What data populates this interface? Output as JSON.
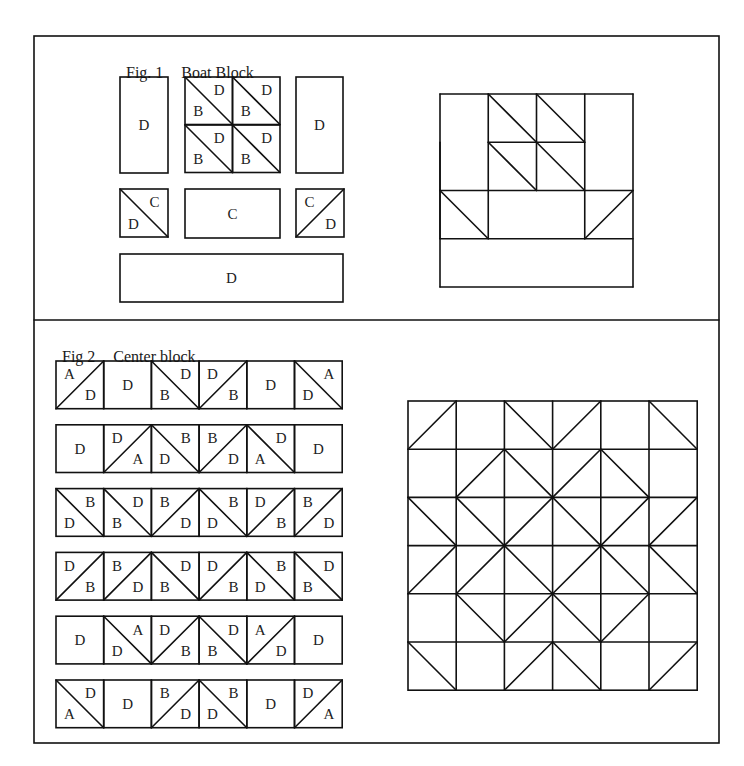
{
  "fig1": {
    "label": "Fig. 1",
    "title": "Boat Block",
    "pieces": [
      {
        "type": "rect",
        "x": 120,
        "y": 77,
        "w": 48,
        "h": 96,
        "label": "D"
      },
      {
        "type": "hst",
        "x": 185,
        "y": 77,
        "s": 47.5,
        "diag": "\\",
        "tl": null,
        "tr": "D",
        "bl": "B",
        "br": null
      },
      {
        "type": "hst",
        "x": 232.5,
        "y": 77,
        "s": 47.5,
        "diag": "\\",
        "tl": null,
        "tr": "D",
        "bl": "B",
        "br": null
      },
      {
        "type": "hst",
        "x": 185,
        "y": 125,
        "s": 47.5,
        "diag": "\\",
        "tl": null,
        "tr": "D",
        "bl": "B",
        "br": null
      },
      {
        "type": "hst",
        "x": 232.5,
        "y": 125,
        "s": 47.5,
        "diag": "\\",
        "tl": null,
        "tr": "D",
        "bl": "B",
        "br": null
      },
      {
        "type": "rect",
        "x": 296,
        "y": 77,
        "w": 47,
        "h": 96,
        "label": "D"
      },
      {
        "type": "hst",
        "x": 120,
        "y": 189,
        "s": 48,
        "diag": "\\",
        "tl": null,
        "tr": "C",
        "bl": "D",
        "br": null
      },
      {
        "type": "rect",
        "x": 185,
        "y": 189,
        "w": 95,
        "h": 49,
        "label": "C"
      },
      {
        "type": "hst",
        "x": 296,
        "y": 189,
        "s": 48,
        "diag": "/",
        "tl": "C",
        "tr": null,
        "bl": null,
        "br": "D"
      },
      {
        "type": "rect",
        "x": 120,
        "y": 254,
        "w": 223,
        "h": 48,
        "label": "D"
      }
    ],
    "assembled": {
      "x": 440,
      "y": 94,
      "cell": 48.25,
      "lines": [
        [
          0,
          0,
          4,
          0
        ],
        [
          0,
          4,
          4,
          4
        ],
        [
          0,
          0,
          0,
          4
        ],
        [
          4,
          0,
          4,
          4
        ],
        [
          1,
          0,
          1,
          3
        ],
        [
          2,
          0,
          2,
          2
        ],
        [
          3,
          0,
          3,
          3
        ],
        [
          0,
          1,
          0,
          3
        ],
        [
          1,
          1,
          3,
          1
        ],
        [
          0,
          2,
          4,
          2
        ],
        [
          0,
          3,
          4,
          3
        ],
        [
          1,
          0,
          2,
          1
        ],
        [
          2,
          0,
          3,
          1
        ],
        [
          1,
          1,
          2,
          2
        ],
        [
          2,
          1,
          3,
          2
        ],
        [
          0,
          2,
          1,
          3
        ],
        [
          4,
          2,
          3,
          3
        ]
      ]
    }
  },
  "fig2": {
    "label": "Fig 2",
    "title": "Center block",
    "rows_origin": {
      "x": 56,
      "y": 361,
      "cell": 47.7,
      "row_pitch": 63.8
    },
    "rows": [
      [
        {
          "diag": "/",
          "tl": "A",
          "br": "D"
        },
        {
          "diag": null,
          "c": "D"
        },
        {
          "diag": "\\",
          "tr": "D",
          "bl": "B"
        },
        {
          "diag": "/",
          "tl": "D",
          "br": "B"
        },
        {
          "diag": null,
          "c": "D"
        },
        {
          "diag": "\\",
          "tr": "A",
          "bl": "D"
        }
      ],
      [
        {
          "diag": null,
          "c": "D"
        },
        {
          "diag": "/",
          "tl": "D",
          "br": "A"
        },
        {
          "diag": "\\",
          "tr": "B",
          "bl": "D"
        },
        {
          "diag": "/",
          "tl": "B",
          "br": "D"
        },
        {
          "diag": "\\",
          "tr": "D",
          "bl": "A"
        },
        {
          "diag": null,
          "c": "D"
        }
      ],
      [
        {
          "diag": "\\",
          "tr": "B",
          "bl": "D"
        },
        {
          "diag": "\\",
          "tr": "D",
          "bl": "B"
        },
        {
          "diag": "/",
          "tl": "B",
          "br": "D"
        },
        {
          "diag": "\\",
          "tr": "B",
          "bl": "D"
        },
        {
          "diag": "/",
          "tl": "D",
          "br": "B"
        },
        {
          "diag": "/",
          "tl": "B",
          "br": "D"
        }
      ],
      [
        {
          "diag": "/",
          "tl": "D",
          "br": "B"
        },
        {
          "diag": "/",
          "tl": "B",
          "br": "D"
        },
        {
          "diag": "\\",
          "tr": "D",
          "bl": "B"
        },
        {
          "diag": "/",
          "tl": "D",
          "br": "B"
        },
        {
          "diag": "\\",
          "tr": "B",
          "bl": "D"
        },
        {
          "diag": "\\",
          "tr": "D",
          "bl": "B"
        }
      ],
      [
        {
          "diag": null,
          "c": "D"
        },
        {
          "diag": "\\",
          "tr": "A",
          "bl": "D"
        },
        {
          "diag": "/",
          "tl": "D",
          "br": "B"
        },
        {
          "diag": "\\",
          "tr": "D",
          "bl": "B"
        },
        {
          "diag": "/",
          "tl": "A",
          "br": "D"
        },
        {
          "diag": null,
          "c": "D"
        }
      ],
      [
        {
          "diag": "\\",
          "tr": "D",
          "bl": "A"
        },
        {
          "diag": null,
          "c": "D"
        },
        {
          "diag": "/",
          "tl": "B",
          "br": "D"
        },
        {
          "diag": "\\",
          "tr": "B",
          "bl": "D"
        },
        {
          "diag": null,
          "c": "D"
        },
        {
          "diag": "/",
          "tl": "D",
          "br": "A"
        }
      ]
    ],
    "assembled": {
      "x": 408,
      "y": 401,
      "cell": 48.2
    }
  },
  "frame": {
    "x": 34,
    "y": 36,
    "w": 685,
    "h": 707,
    "divider_y": 320
  },
  "colors": {
    "line": "#111111",
    "background": "#ffffff",
    "text": "#222222"
  }
}
